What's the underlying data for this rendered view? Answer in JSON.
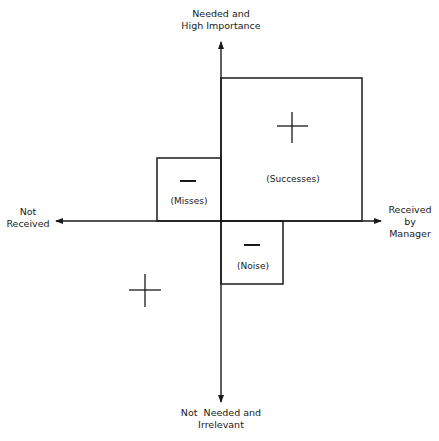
{
  "axes": {
    "top_label": [
      "Needed and",
      "High Importance"
    ],
    "bottom_label": [
      "Not  Needed and",
      "Irrelevant"
    ],
    "left_label": [
      "Not",
      "Received"
    ],
    "right_label": [
      "Received",
      "by",
      "Manager"
    ]
  },
  "regions": {
    "successes": {
      "label": "(Successes)",
      "sign": "+"
    },
    "misses": {
      "label": "(Misses)",
      "sign": "−"
    },
    "noise": {
      "label": "(Noise)",
      "sign": "−"
    },
    "not_received_not_needed": {
      "label": "",
      "sign": "+"
    }
  },
  "colors": {
    "ink": "#1a1a1a",
    "background": "#ffffff"
  }
}
